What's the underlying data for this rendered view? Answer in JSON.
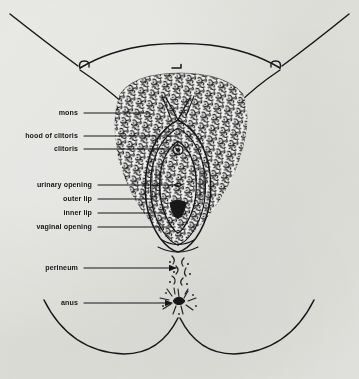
{
  "figure": {
    "medium": "printed book illustration, pen-and-ink line drawing with stipple shading",
    "background_color": "#eeeeec",
    "ink_color": "#17171a",
    "width": 359,
    "height": 379,
    "labels": [
      {
        "id": "mons",
        "text": "mons",
        "text_x": 78,
        "y": 113,
        "line_start_x": 84,
        "line_end_x": 150,
        "arrow": false
      },
      {
        "id": "hood-of-clitoris",
        "text": "hood of clitoris",
        "text_x": 78,
        "y": 136,
        "line_start_x": 84,
        "line_end_x": 176,
        "arrow": false
      },
      {
        "id": "clitoris",
        "text": "clitoris",
        "text_x": 78,
        "y": 149,
        "line_start_x": 84,
        "line_end_x": 172,
        "arrow": false
      },
      {
        "id": "urinary-opening",
        "text": "urinary opening",
        "text_x": 92,
        "y": 185,
        "line_start_x": 98,
        "line_end_x": 178,
        "arrow": false
      },
      {
        "id": "outer-lip",
        "text": "outer lip",
        "text_x": 92,
        "y": 199,
        "line_start_x": 98,
        "line_end_x": 152,
        "arrow": false
      },
      {
        "id": "inner-lip",
        "text": "inner lip",
        "text_x": 92,
        "y": 213,
        "line_start_x": 98,
        "line_end_x": 166,
        "arrow": false
      },
      {
        "id": "vaginal-opening",
        "text": "vaginal opening",
        "text_x": 92,
        "y": 227,
        "line_start_x": 98,
        "line_end_x": 172,
        "arrow": false
      },
      {
        "id": "perineum",
        "text": "perineum",
        "text_x": 78,
        "y": 268,
        "line_start_x": 84,
        "line_end_x": 176,
        "arrow": true
      },
      {
        "id": "anus",
        "text": "anus",
        "text_x": 78,
        "y": 303,
        "line_start_x": 84,
        "line_end_x": 172,
        "arrow": true
      }
    ]
  }
}
